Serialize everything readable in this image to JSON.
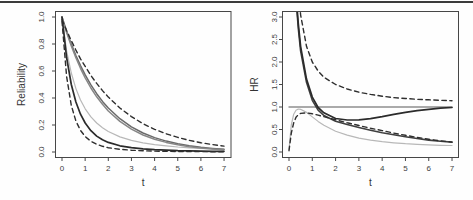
{
  "page": {
    "background": "#fefefe",
    "top_rule_color": "#3c3c3c"
  },
  "chart_data": [
    {
      "type": "line",
      "title": "",
      "xlabel": "t",
      "ylabel": "Reliability",
      "xlim": [
        0,
        7
      ],
      "ylim": [
        0,
        1
      ],
      "grid": false,
      "legend": "none",
      "axis_color": "#474747",
      "xtick_values": [
        0,
        1,
        2,
        3,
        4,
        5,
        6,
        7
      ],
      "xticks": [
        "0",
        "1",
        "2",
        "3",
        "4",
        "5",
        "6",
        "7"
      ],
      "ytick_values": [
        0,
        0.2,
        0.4,
        0.6,
        0.8,
        1.0
      ],
      "yticks": [
        "0.0",
        "0.2",
        "0.4",
        "0.6",
        "0.8",
        "1.0"
      ],
      "series": [
        {
          "name": "km-curve-light",
          "style": "solid",
          "color": "#b8b8b8",
          "width": 1.2,
          "x": [
            0,
            0.2,
            0.4,
            0.6,
            0.8,
            1,
            1.25,
            1.5,
            1.75,
            2,
            2.5,
            3,
            3.5,
            4,
            4.5,
            5,
            5.5,
            6,
            6.5,
            7
          ],
          "y": [
            1.0,
            0.75,
            0.585,
            0.47,
            0.385,
            0.32,
            0.26,
            0.215,
            0.18,
            0.152,
            0.112,
            0.086,
            0.068,
            0.055,
            0.045,
            0.037,
            0.031,
            0.026,
            0.022,
            0.019
          ]
        },
        {
          "name": "fit-gray-1",
          "style": "solid",
          "color": "#6a6a6a",
          "width": 1.5,
          "x": [
            0,
            0.2,
            0.4,
            0.6,
            0.8,
            1,
            1.25,
            1.5,
            1.75,
            2,
            2.5,
            3,
            3.5,
            4,
            4.5,
            5,
            5.5,
            6,
            6.5,
            7
          ],
          "y": [
            1.0,
            0.894,
            0.8,
            0.715,
            0.64,
            0.571,
            0.497,
            0.432,
            0.375,
            0.326,
            0.247,
            0.187,
            0.141,
            0.107,
            0.081,
            0.061,
            0.046,
            0.035,
            0.027,
            0.02
          ]
        },
        {
          "name": "fit-gray-2",
          "style": "solid",
          "color": "#878787",
          "width": 1.5,
          "x": [
            0,
            0.2,
            0.4,
            0.6,
            0.8,
            1,
            1.25,
            1.5,
            1.75,
            2,
            2.5,
            3,
            3.5,
            4,
            4.5,
            5,
            5.5,
            6,
            6.5,
            7
          ],
          "y": [
            1.0,
            0.885,
            0.786,
            0.698,
            0.62,
            0.55,
            0.474,
            0.409,
            0.353,
            0.304,
            0.227,
            0.169,
            0.126,
            0.094,
            0.071,
            0.053,
            0.039,
            0.029,
            0.022,
            0.016
          ]
        },
        {
          "name": "ci-upper-dashed",
          "style": "dashed",
          "color": "#2e2e2e",
          "width": 1.4,
          "x": [
            0,
            0.2,
            0.4,
            0.6,
            0.8,
            1,
            1.25,
            1.5,
            1.75,
            2,
            2.5,
            3,
            3.5,
            4,
            4.5,
            5,
            5.5,
            6,
            6.5,
            7
          ],
          "y": [
            0.98,
            0.9,
            0.825,
            0.755,
            0.69,
            0.635,
            0.567,
            0.508,
            0.455,
            0.407,
            0.326,
            0.262,
            0.21,
            0.168,
            0.135,
            0.108,
            0.086,
            0.069,
            0.055,
            0.044
          ]
        },
        {
          "name": "fit-black",
          "style": "solid",
          "color": "#2b2b2b",
          "width": 1.7,
          "x": [
            0,
            0.2,
            0.4,
            0.6,
            0.8,
            1,
            1.25,
            1.5,
            1.75,
            2,
            2.5,
            3,
            3.5,
            4,
            4.5,
            5,
            5.5,
            6,
            6.5,
            7
          ],
          "y": [
            1.0,
            0.7,
            0.5,
            0.37,
            0.28,
            0.215,
            0.158,
            0.118,
            0.091,
            0.071,
            0.046,
            0.032,
            0.023,
            0.017,
            0.013,
            0.01,
            0.008,
            0.0065,
            0.0055,
            0.005
          ]
        },
        {
          "name": "ci-lower-dashed",
          "style": "dashed",
          "color": "#2e2e2e",
          "width": 1.4,
          "x": [
            0,
            0.2,
            0.4,
            0.6,
            0.8,
            1,
            1.25,
            1.5,
            1.75,
            2,
            2.5,
            3,
            3.5,
            4,
            4.5,
            5,
            5.5,
            6,
            6.5,
            7
          ],
          "y": [
            0.97,
            0.56,
            0.345,
            0.23,
            0.16,
            0.115,
            0.079,
            0.057,
            0.042,
            0.032,
            0.02,
            0.013,
            0.009,
            0.0065,
            0.005,
            0.004,
            0.0035,
            0.003,
            0.0025,
            0.002
          ]
        }
      ]
    },
    {
      "type": "line",
      "title": "",
      "xlabel": "t",
      "ylabel": "HR",
      "xlim": [
        0,
        7
      ],
      "ylim": [
        0,
        3
      ],
      "grid": false,
      "legend": "none",
      "axis_color": "#474747",
      "xtick_values": [
        0,
        1,
        2,
        3,
        4,
        5,
        6,
        7
      ],
      "xticks": [
        "0",
        "1",
        "2",
        "3",
        "4",
        "5",
        "6",
        "7"
      ],
      "ytick_values": [
        0,
        0.5,
        1.0,
        1.5,
        2.0,
        2.5,
        3.0
      ],
      "yticks": [
        "0.0",
        "0.5",
        "1.0",
        "1.5",
        "2.0",
        "2.5",
        "3.0"
      ],
      "series": [
        {
          "name": "reference-line",
          "style": "solid",
          "color": "#8e8e8e",
          "width": 1.4,
          "x": [
            0,
            7
          ],
          "y": [
            1.0,
            1.0
          ]
        },
        {
          "name": "light-gray-curve",
          "style": "solid",
          "color": "#b8b8b8",
          "width": 1.2,
          "x": [
            0,
            0.1,
            0.2,
            0.3,
            0.4,
            0.5,
            0.75,
            1,
            1.25,
            1.5,
            2,
            2.5,
            3,
            3.5,
            4,
            4.5,
            5,
            5.5,
            6,
            6.5,
            7
          ],
          "y": [
            0.06,
            0.6,
            0.84,
            0.93,
            0.955,
            0.95,
            0.88,
            0.78,
            0.68,
            0.595,
            0.46,
            0.375,
            0.31,
            0.265,
            0.23,
            0.205,
            0.185,
            0.17,
            0.158,
            0.15,
            0.145
          ]
        },
        {
          "name": "hr-declining-curve",
          "style": "solid",
          "color": "#3f3f3f",
          "width": 1.6,
          "x": [
            0,
            0.1,
            0.2,
            0.3,
            0.4,
            0.5,
            0.75,
            1,
            1.25,
            1.5,
            2,
            2.5,
            3,
            3.5,
            4,
            4.5,
            5,
            5.5,
            6,
            6.5,
            7
          ],
          "y": [
            6.4,
            5.3,
            4.3,
            3.4,
            2.75,
            2.25,
            1.55,
            1.15,
            0.93,
            0.81,
            0.685,
            0.61,
            0.545,
            0.485,
            0.43,
            0.385,
            0.34,
            0.3,
            0.265,
            0.24,
            0.22
          ]
        },
        {
          "name": "hr-converging-curve",
          "style": "solid",
          "color": "#2b2b2b",
          "width": 1.7,
          "x": [
            0,
            0.1,
            0.2,
            0.3,
            0.4,
            0.5,
            0.75,
            1,
            1.25,
            1.5,
            2,
            2.5,
            3,
            3.5,
            4,
            4.5,
            5,
            5.5,
            6,
            6.5,
            7
          ],
          "y": [
            6.5,
            5.4,
            4.4,
            3.5,
            2.85,
            2.35,
            1.62,
            1.22,
            0.99,
            0.87,
            0.745,
            0.71,
            0.715,
            0.74,
            0.785,
            0.835,
            0.88,
            0.92,
            0.95,
            0.975,
            0.99
          ]
        },
        {
          "name": "ci-upper-dashed",
          "style": "dashed",
          "color": "#2e2e2e",
          "width": 1.4,
          "x": [
            0,
            0.1,
            0.2,
            0.3,
            0.4,
            0.5,
            0.75,
            1,
            1.25,
            1.5,
            2,
            2.5,
            3,
            3.5,
            4,
            4.5,
            5,
            5.5,
            6,
            6.5,
            7
          ],
          "y": [
            7.0,
            6.0,
            5.1,
            4.3,
            3.6,
            3.05,
            2.35,
            2.0,
            1.8,
            1.66,
            1.5,
            1.4,
            1.33,
            1.28,
            1.24,
            1.21,
            1.19,
            1.17,
            1.16,
            1.15,
            1.14
          ]
        },
        {
          "name": "ci-lower-dashed",
          "style": "dashed",
          "color": "#2e2e2e",
          "width": 1.4,
          "x": [
            0,
            0.1,
            0.2,
            0.3,
            0.4,
            0.5,
            0.75,
            1,
            1.25,
            1.5,
            2,
            2.5,
            3,
            3.5,
            4,
            4.5,
            5,
            5.5,
            6,
            6.5,
            7
          ],
          "y": [
            0.03,
            0.42,
            0.65,
            0.77,
            0.83,
            0.857,
            0.868,
            0.85,
            0.82,
            0.785,
            0.715,
            0.65,
            0.59,
            0.53,
            0.475,
            0.42,
            0.37,
            0.325,
            0.285,
            0.25,
            0.22
          ]
        }
      ]
    }
  ]
}
